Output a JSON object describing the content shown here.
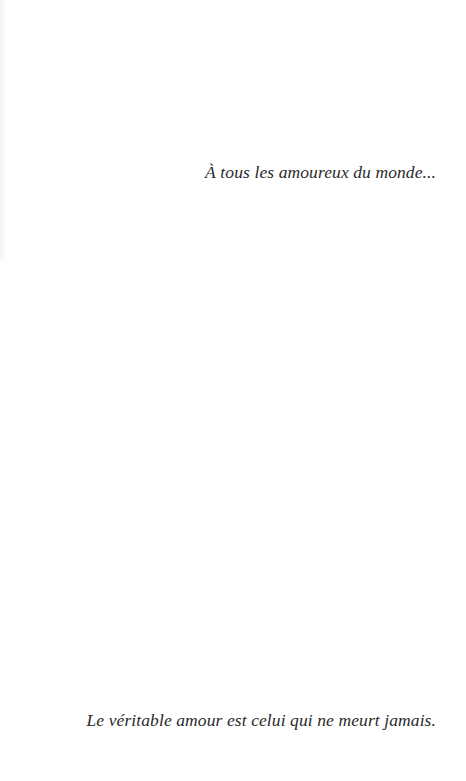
{
  "page": {
    "dedication": "À tous les amoureux du monde...",
    "epigraph": "Le véritable amour est celui qui ne meurt jamais."
  },
  "colors": {
    "background": "#ffffff",
    "text": "#2a2a2a"
  }
}
